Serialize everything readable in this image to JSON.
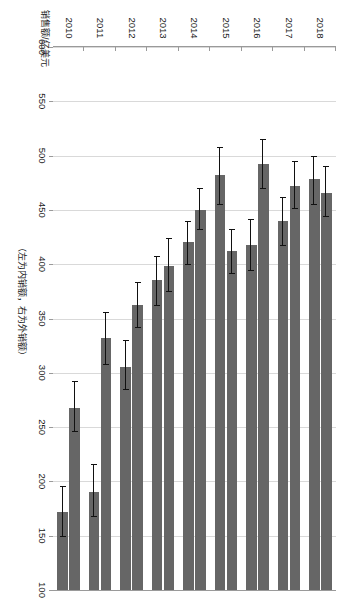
{
  "chart_data": {
    "type": "bar",
    "orientation": "horizontal-grouped",
    "title": "",
    "xlabel": "",
    "ylabel": "销售额/亿美元",
    "note": "（左为内销额，右为外销额）",
    "categories": [
      "2010",
      "2011",
      "2012",
      "2013",
      "2014",
      "2015",
      "2016",
      "2017",
      "2018"
    ],
    "value_ticks": [
      600,
      550,
      500,
      450,
      400,
      350,
      300,
      250,
      200,
      150,
      100
    ],
    "value_axis_reversed": true,
    "vlim": [
      100,
      600
    ],
    "grid": true,
    "legend": "none",
    "bar_color": "#666666",
    "error_bar_color": "#111111",
    "series": [
      {
        "name": "内销额",
        "label": "Domestic sales",
        "values": [
          172,
          190,
          305,
          385,
          420,
          482,
          418,
          440,
          478
        ],
        "err_low": [
          150,
          168,
          285,
          362,
          400,
          455,
          395,
          418,
          455
        ],
        "err_high": [
          196,
          216,
          330,
          408,
          440,
          508,
          442,
          462,
          500
        ]
      },
      {
        "name": "外销额",
        "label": "Export sales",
        "values": [
          268,
          332,
          362,
          398,
          450,
          412,
          492,
          472,
          466
        ],
        "err_low": [
          246,
          308,
          342,
          375,
          432,
          392,
          470,
          452,
          444
        ],
        "err_high": [
          292,
          356,
          384,
          424,
          470,
          432,
          515,
          495,
          490
        ]
      }
    ]
  }
}
